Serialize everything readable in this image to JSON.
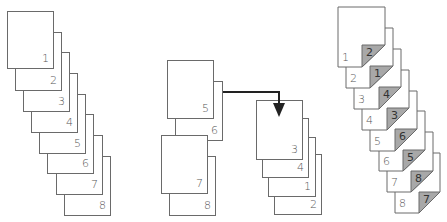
{
  "colors": {
    "page_fill": "#ffffff",
    "page_stroke": "#6a6a6a",
    "flap_fill": "#a8a8a8",
    "arrow": "#222222",
    "number_text": "#555555"
  },
  "left_group": {
    "description": "Sequential pages stacked diagonally",
    "pages": [
      {
        "label": "1"
      },
      {
        "label": "2"
      },
      {
        "label": "3"
      },
      {
        "label": "4"
      },
      {
        "label": "5"
      },
      {
        "label": "6"
      },
      {
        "label": "7"
      },
      {
        "label": "8"
      }
    ]
  },
  "middle_group": {
    "pair_a": [
      {
        "label": "5"
      },
      {
        "label": "6"
      }
    ],
    "pair_b": [
      {
        "label": "7"
      },
      {
        "label": "8"
      }
    ],
    "stack_c": [
      {
        "label": "3"
      },
      {
        "label": "4"
      },
      {
        "label": "1"
      },
      {
        "label": "2"
      }
    ],
    "arrow": {
      "from": "pair_a",
      "to": "stack_c"
    }
  },
  "right_group": {
    "description": "Pages with folded corner showing back-side page number",
    "pages": [
      {
        "label": "1",
        "flap": "2"
      },
      {
        "label": "2",
        "flap": "1"
      },
      {
        "label": "3",
        "flap": "4"
      },
      {
        "label": "4",
        "flap": "3"
      },
      {
        "label": "5",
        "flap": "6"
      },
      {
        "label": "6",
        "flap": "5"
      },
      {
        "label": "7",
        "flap": "8"
      },
      {
        "label": "8",
        "flap": "7"
      }
    ]
  }
}
